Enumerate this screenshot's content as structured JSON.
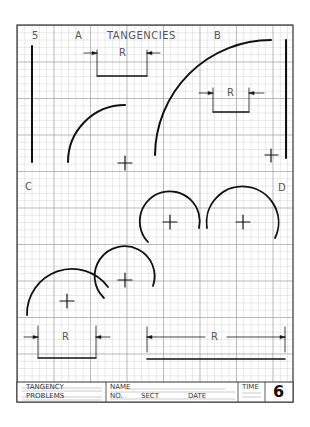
{
  "sheet": {
    "number": "5",
    "title": "TANGENCIES",
    "section_labels": [
      "A",
      "B",
      "C",
      "D"
    ],
    "dimension_label": "R",
    "colors": {
      "grid_minor": "#bdbdbd",
      "grid_major": "#8a8a8a",
      "ink": "#111111",
      "label": "#555555"
    }
  },
  "title_block": {
    "subject_line1": "TANGENCY",
    "subject_line2": "PROBLEMS",
    "name_label": "NAME",
    "no_label": "NO.",
    "sect_label": "SECT",
    "date_label": "DATE",
    "time_label": "TIME",
    "sheet_number": "6"
  }
}
